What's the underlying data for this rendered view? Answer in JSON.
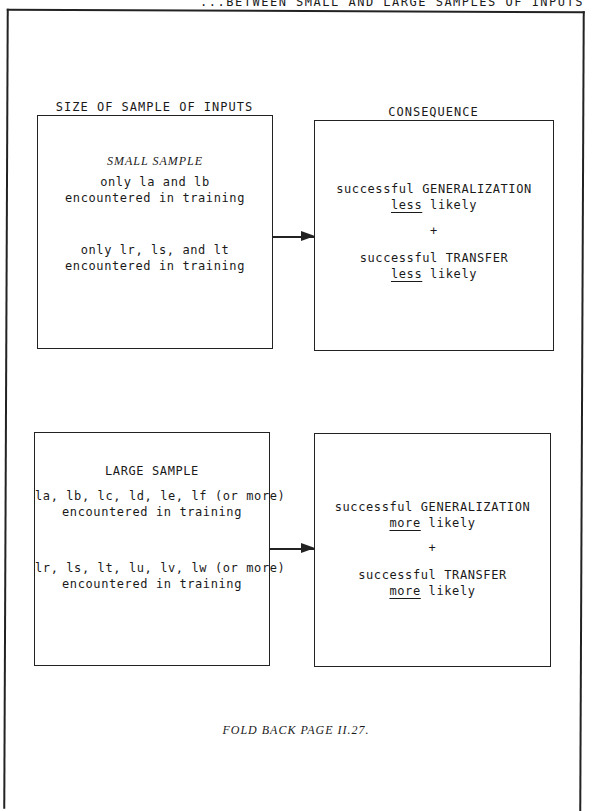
{
  "header": {
    "title_fragment": "...BETWEEN SMALL AND LARGE SAMPLES OF INPUTS"
  },
  "columns": {
    "left_label": "SIZE OF SAMPLE OF INPUTS",
    "right_label": "CONSEQUENCE"
  },
  "rows": [
    {
      "input": {
        "title": "SMALL SAMPLE",
        "groups": [
          {
            "line1": "only la and lb",
            "line2": "encountered in training"
          },
          {
            "line1": "only lr, ls, and lt",
            "line2": "encountered in training"
          }
        ]
      },
      "consequence": {
        "item1_line1": "successful GENERALIZATION",
        "item1_emph": "less",
        "item1_rest": " likely",
        "connector": "+",
        "item2_line1": "successful TRANSFER",
        "item2_emph": "less",
        "item2_rest": " likely"
      }
    },
    {
      "input": {
        "title": "LARGE SAMPLE",
        "groups": [
          {
            "line1": "la, lb, lc, ld, le, lf (or more)",
            "line2": "encountered in training"
          },
          {
            "line1": "lr, ls, lt, lu, lv, lw (or more)",
            "line2": "encountered in training"
          }
        ]
      },
      "consequence": {
        "item1_line1": "successful GENERALIZATION",
        "item1_emph": "more",
        "item1_rest": " likely",
        "connector": "+",
        "item2_line1": "successful TRANSFER",
        "item2_emph": "more",
        "item2_rest": " likely"
      }
    }
  ],
  "footer": {
    "note": "FOLD BACK PAGE II.27."
  }
}
